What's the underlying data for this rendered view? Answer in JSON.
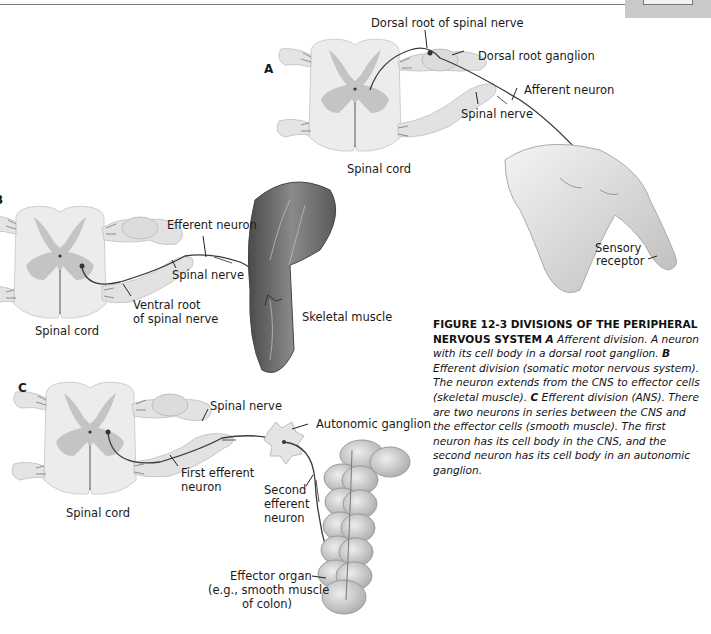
{
  "page": {
    "header": {
      "page_tab": ""
    }
  },
  "figure": {
    "panels": {
      "A": {
        "letter": "A",
        "labels": {
          "dorsal_root": "Dorsal root of spinal nerve",
          "dorsal_root_ganglion": "Dorsal root ganglion",
          "afferent_neuron": "Afferent neuron",
          "spinal_nerve": "Spinal nerve",
          "spinal_cord": "Spinal cord",
          "sensory_receptor_1": "Sensory",
          "sensory_receptor_2": "receptor"
        }
      },
      "B": {
        "letter": "B",
        "labels": {
          "efferent_neuron": "Efferent neuron",
          "spinal_nerve": "Spinal nerve",
          "ventral_root_1": "Ventral root",
          "ventral_root_2": "of spinal nerve",
          "spinal_cord": "Spinal cord",
          "skeletal_muscle": "Skeletal muscle"
        }
      },
      "C": {
        "letter": "C",
        "labels": {
          "spinal_nerve": "Spinal nerve",
          "autonomic_ganglion": "Autonomic ganglion",
          "first_efferent_1": "First efferent",
          "first_efferent_2": "neuron",
          "second_efferent_1": "Second",
          "second_efferent_2": "efferent",
          "second_efferent_3": "neuron",
          "spinal_cord": "Spinal cord",
          "effector_organ_1": "Effector organ",
          "effector_organ_2": "(e.g., smooth muscle",
          "effector_organ_3": "of colon)"
        }
      }
    },
    "caption": {
      "title": "FIGURE 12-3 DIVISIONS OF THE PERIPHERAL NERVOUS SYSTEM",
      "a_key": "A",
      "a_text": "Afferent division. A neuron with its cell body in a dorsal root ganglion.",
      "b_key": "B",
      "b_text": "Efferent division (somatic motor nervous system). The neuron extends from the CNS to effector cells (skeletal muscle).",
      "c_key": "C",
      "c_text": "Efferent division (ANS). There are two neurons in series between the CNS and the effector cells (smooth muscle). The first neuron has its cell body in the CNS, and the second neuron has its cell body in an autonomic ganglion."
    },
    "colors": {
      "white_matter": "#ececec",
      "gray_matter": "#c4c4c4",
      "nerve": "#e2e2e2",
      "neuron_line": "#3a3a3a",
      "muscle": "#6e6e6e",
      "skin": "#dcdcdc",
      "colon": "#c8c8c8"
    }
  }
}
